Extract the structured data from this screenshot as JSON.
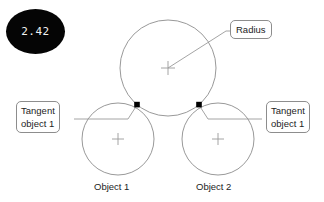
{
  "diagram": {
    "type": "geometry-construction",
    "background_color": "#ffffff",
    "stroke_color": "#8d8d8d",
    "marker_color": "#000000",
    "badge": {
      "value": "2.42",
      "background_color": "#050505",
      "text_color": "#f2f2f2",
      "shape": "ellipse"
    },
    "callouts": [
      {
        "name": "radius",
        "lines": [
          "Radius"
        ],
        "anchor": "large-circle-radius-line"
      },
      {
        "name": "tangent-object-1",
        "lines": [
          "Tangent",
          "object 1"
        ],
        "anchor": "left-tangent-point"
      },
      {
        "name": "tangent-object-2",
        "lines": [
          "Tangent",
          "object 1"
        ],
        "anchor": "right-tangent-point"
      }
    ],
    "captions": [
      {
        "name": "object-1",
        "text": "Object 1"
      },
      {
        "name": "object-2",
        "text": "Object 2"
      }
    ],
    "shapes": {
      "large_circle": {
        "cx": 168,
        "cy": 68,
        "r": 48,
        "center_marker": "crosshair"
      },
      "left_circle": {
        "cx": 118,
        "cy": 139,
        "r": 36,
        "center_marker": "crosshair"
      },
      "right_circle": {
        "cx": 218,
        "cy": 139,
        "r": 36,
        "center_marker": "crosshair"
      },
      "tangent_points": [
        {
          "x": 137,
          "y": 105
        },
        {
          "x": 199,
          "y": 105
        }
      ],
      "radius_line": {
        "x1": 168,
        "y1": 68,
        "x2": 228,
        "y2": 30
      }
    }
  }
}
